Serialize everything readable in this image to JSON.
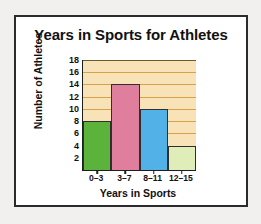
{
  "chart_data": {
    "type": "bar",
    "title": "Years in Sports for Athletes",
    "xlabel": "Years in Sports",
    "ylabel": "Number of Athletes",
    "categories": [
      "0–3",
      "3–7",
      "8–11",
      "12–15"
    ],
    "values": [
      8,
      14,
      10,
      4
    ],
    "ylim": [
      0,
      18
    ],
    "yticks": [
      18,
      16,
      14,
      12,
      10,
      8,
      6,
      4,
      2
    ],
    "grid": "horizontal",
    "legend": "none",
    "bar_colors": [
      "#5cb33c",
      "#e07f9d",
      "#52b2e8",
      "#dfeeb8"
    ],
    "plot_background": "#f8e3b9",
    "gridline_color": "#d9a248",
    "axis_color": "#1d1d1d",
    "bar_border_color": "#2f2f2f",
    "card_background": "#ffffff",
    "card_border_color": "#2b2b2b",
    "page_background": "#f1f0ee",
    "text_color": "#111111"
  }
}
